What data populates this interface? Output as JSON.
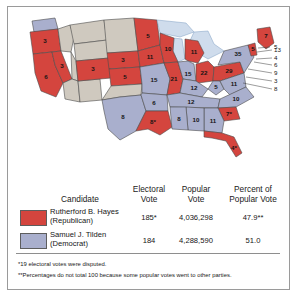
{
  "figure": {
    "kind": "electoral-map-with-table",
    "year": 1876
  },
  "colors": {
    "republican": "#d4453e",
    "democrat": "#a9afcd",
    "territory": "#cfc9bf",
    "water": "#cfdcec",
    "outline": "#4c4c4c",
    "frame": "#9a9a9a",
    "text": "#161616"
  },
  "map": {
    "states": [
      {
        "name": "Washington Territory",
        "abbr": "WA",
        "party": "democrat",
        "votes": ""
      },
      {
        "name": "Oregon",
        "abbr": "OR",
        "party": "republican",
        "votes": "3"
      },
      {
        "name": "California",
        "abbr": "CA",
        "party": "republican",
        "votes": "6"
      },
      {
        "name": "Nevada",
        "abbr": "NV",
        "party": "republican",
        "votes": "3"
      },
      {
        "name": "Idaho Territory",
        "abbr": "ID",
        "party": "territory",
        "votes": ""
      },
      {
        "name": "Montana Territory",
        "abbr": "MT",
        "party": "territory",
        "votes": ""
      },
      {
        "name": "Wyoming Territory",
        "abbr": "WY",
        "party": "territory",
        "votes": ""
      },
      {
        "name": "Utah Territory",
        "abbr": "UT",
        "party": "territory",
        "votes": ""
      },
      {
        "name": "Arizona Territory",
        "abbr": "AZ",
        "party": "territory",
        "votes": ""
      },
      {
        "name": "New Mexico Territory",
        "abbr": "NM",
        "party": "territory",
        "votes": ""
      },
      {
        "name": "Colorado",
        "abbr": "CO",
        "party": "republican",
        "votes": "3"
      },
      {
        "name": "Dakota Territory",
        "abbr": "DT",
        "party": "territory",
        "votes": ""
      },
      {
        "name": "Nebraska",
        "abbr": "NE",
        "party": "republican",
        "votes": "3"
      },
      {
        "name": "Kansas",
        "abbr": "KS",
        "party": "republican",
        "votes": "5"
      },
      {
        "name": "Indian Territory",
        "abbr": "IT",
        "party": "territory",
        "votes": ""
      },
      {
        "name": "Texas",
        "abbr": "TX",
        "party": "democrat",
        "votes": "8"
      },
      {
        "name": "Minnesota",
        "abbr": "MN",
        "party": "republican",
        "votes": "5"
      },
      {
        "name": "Iowa",
        "abbr": "IA",
        "party": "republican",
        "votes": "11"
      },
      {
        "name": "Missouri",
        "abbr": "MO",
        "party": "democrat",
        "votes": "15"
      },
      {
        "name": "Arkansas",
        "abbr": "AR",
        "party": "democrat",
        "votes": "6"
      },
      {
        "name": "Louisiana",
        "abbr": "LA",
        "party": "republican",
        "votes": "8*"
      },
      {
        "name": "Wisconsin",
        "abbr": "WI",
        "party": "republican",
        "votes": "10"
      },
      {
        "name": "Illinois",
        "abbr": "IL",
        "party": "republican",
        "votes": "21"
      },
      {
        "name": "Michigan",
        "abbr": "MI",
        "party": "republican",
        "votes": "11"
      },
      {
        "name": "Indiana",
        "abbr": "IN",
        "party": "democrat",
        "votes": "15"
      },
      {
        "name": "Ohio",
        "abbr": "OH",
        "party": "republican",
        "votes": "22"
      },
      {
        "name": "Kentucky",
        "abbr": "KY",
        "party": "democrat",
        "votes": "12"
      },
      {
        "name": "Tennessee",
        "abbr": "TN",
        "party": "democrat",
        "votes": "12"
      },
      {
        "name": "Mississippi",
        "abbr": "MS",
        "party": "democrat",
        "votes": "8"
      },
      {
        "name": "Alabama",
        "abbr": "AL",
        "party": "democrat",
        "votes": "10"
      },
      {
        "name": "Georgia",
        "abbr": "GA",
        "party": "democrat",
        "votes": "11"
      },
      {
        "name": "Florida",
        "abbr": "FL",
        "party": "republican",
        "votes": "4*"
      },
      {
        "name": "South Carolina",
        "abbr": "SC",
        "party": "republican",
        "votes": "7*"
      },
      {
        "name": "North Carolina",
        "abbr": "NC",
        "party": "democrat",
        "votes": "10"
      },
      {
        "name": "Virginia",
        "abbr": "VA",
        "party": "democrat",
        "votes": "11"
      },
      {
        "name": "West Virginia",
        "abbr": "WV",
        "party": "democrat",
        "votes": "5"
      },
      {
        "name": "Pennsylvania",
        "abbr": "PA",
        "party": "republican",
        "votes": "29"
      },
      {
        "name": "New York",
        "abbr": "NY",
        "party": "democrat",
        "votes": "35"
      },
      {
        "name": "Maine",
        "abbr": "ME",
        "party": "republican",
        "votes": "7"
      },
      {
        "name": "Vermont",
        "abbr": "VT",
        "party": "republican",
        "votes": "5"
      }
    ],
    "callouts": [
      {
        "name": "New Hampshire",
        "abbr": "NH",
        "party": "republican",
        "votes": "5"
      },
      {
        "name": "Massachusetts",
        "abbr": "MA",
        "party": "republican",
        "votes": "13"
      },
      {
        "name": "Rhode Island",
        "abbr": "RI",
        "party": "republican",
        "votes": "4"
      },
      {
        "name": "Connecticut",
        "abbr": "CT",
        "party": "democrat",
        "votes": "6"
      },
      {
        "name": "New Jersey",
        "abbr": "NJ",
        "party": "democrat",
        "votes": "9"
      },
      {
        "name": "Delaware",
        "abbr": "DE",
        "party": "democrat",
        "votes": "3"
      },
      {
        "name": "Maryland",
        "abbr": "MD",
        "party": "democrat",
        "votes": "8"
      }
    ]
  },
  "table": {
    "headers": {
      "candidate": "Candidate",
      "electoral_vote_l1": "Electoral",
      "electoral_vote_l2": "Vote",
      "popular_vote_l1": "Popular",
      "popular_vote_l2": "Vote",
      "percent_l1": "Percent of",
      "percent_l2": "Popular Vote"
    },
    "rows": [
      {
        "swatch_color": "#d4453e",
        "name": "Rutherford B. Hayes",
        "party": "(Republican)",
        "electoral_vote": "185*",
        "popular_vote": "4,036,298",
        "percent": "47.9**"
      },
      {
        "swatch_color": "#a9afcd",
        "name": "Samuel J. Tilden",
        "party": "(Democrat)",
        "electoral_vote": "184",
        "popular_vote": "4,288,590",
        "percent": "51.0"
      }
    ]
  },
  "footnotes": [
    {
      "marker": "*",
      "text": "19 electoral votes were disputed."
    },
    {
      "marker": "**",
      "text": "Percentages do not total 100 because some popular votes went to other parties."
    }
  ]
}
